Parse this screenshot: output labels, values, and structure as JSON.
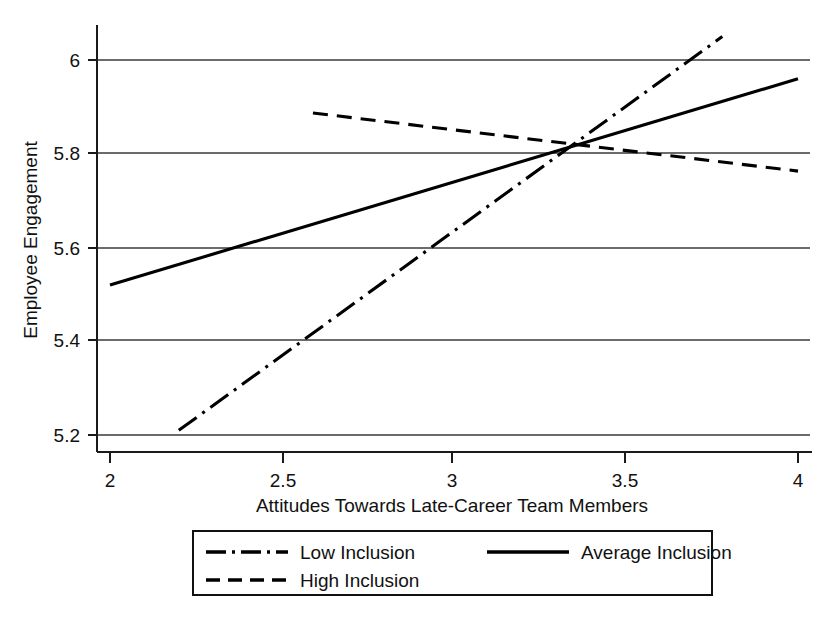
{
  "chart_data": {
    "type": "line",
    "title": "",
    "xlabel": "Attitudes Towards Late-Career Team Members",
    "ylabel": "Employee Engagement",
    "xlim": [
      1.92,
      4.07
    ],
    "ylim": [
      5.155,
      6.09
    ],
    "xticks": [
      2,
      2.5,
      3,
      3.5,
      4
    ],
    "xtick_labels": [
      "2",
      "2.5",
      "3",
      "3.5",
      "4"
    ],
    "yticks": [
      5.2,
      5.4,
      5.6,
      5.8,
      6
    ],
    "ytick_labels": [
      "5.2",
      "5.4",
      "5.6",
      "5.8",
      "6"
    ],
    "grid": "horizontal",
    "legend_position": "bottom",
    "series": [
      {
        "name": "Low Inclusion",
        "style": "dash-dot",
        "x": [
          2.2,
          3.78
        ],
        "y": [
          5.21,
          6.05
        ],
        "color": "#000000"
      },
      {
        "name": "Average Inclusion",
        "style": "solid",
        "x": [
          2.0,
          4.0
        ],
        "y": [
          5.52,
          5.96
        ],
        "color": "#000000"
      },
      {
        "name": "High Inclusion",
        "style": "dashed",
        "x": [
          2.59,
          4.0
        ],
        "y": [
          5.887,
          5.763
        ],
        "color": "#000000"
      }
    ],
    "annotations": [
      {
        "text": "lines cross",
        "x": 3.34,
        "y": 5.81
      }
    ]
  },
  "axes": {
    "y_title": "Employee Engagement",
    "x_title": "Attitudes Towards Late-Career Team Members",
    "y_tick_0": "5.2",
    "y_tick_1": "5.4",
    "y_tick_2": "5.6",
    "y_tick_3": "5.8",
    "y_tick_4": "6",
    "x_tick_0": "2",
    "x_tick_1": "2.5",
    "x_tick_2": "3",
    "x_tick_3": "3.5",
    "x_tick_4": "4"
  },
  "legend": {
    "items": [
      {
        "label": "Low Inclusion",
        "style": "dash-dot"
      },
      {
        "label": "Average Inclusion",
        "style": "solid"
      },
      {
        "label": "High Inclusion",
        "style": "dashed"
      }
    ]
  }
}
